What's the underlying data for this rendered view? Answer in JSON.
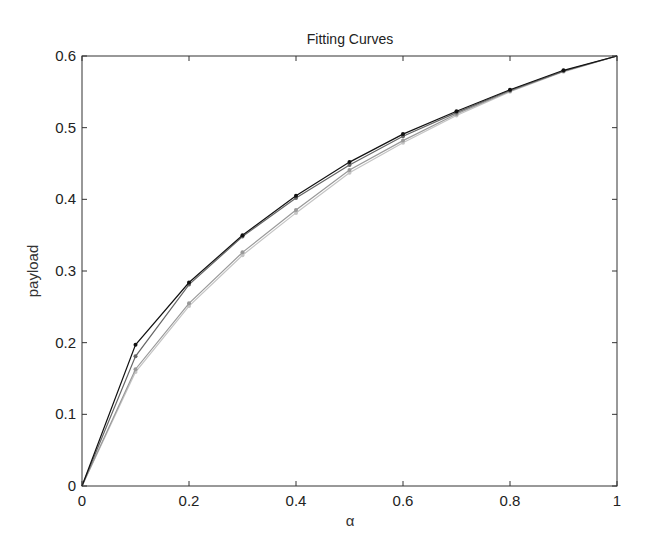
{
  "chart_data": {
    "type": "line",
    "title": "Fitting Curves",
    "xlabel": "α",
    "ylabel": "payload",
    "xlim": [
      0,
      1
    ],
    "ylim": [
      0,
      0.6
    ],
    "grid": false,
    "box": true,
    "legend": null,
    "x_ticks": [
      "0",
      "0.2",
      "0.4",
      "0.6",
      "0.8",
      "1"
    ],
    "y_ticks": [
      "0",
      "0.1",
      "0.2",
      "0.3",
      "0.4",
      "0.5",
      "0.6"
    ],
    "x": [
      0,
      0.1,
      0.2,
      0.3,
      0.4,
      0.5,
      0.6,
      0.7,
      0.8,
      0.9,
      1.0
    ],
    "series": [
      {
        "name": "curve-1",
        "color": "#111111",
        "values": [
          0,
          0.197,
          0.284,
          0.35,
          0.405,
          0.452,
          0.491,
          0.523,
          0.553,
          0.58,
          0.6
        ]
      },
      {
        "name": "curve-2",
        "color": "#666666",
        "values": [
          0,
          0.181,
          0.281,
          0.348,
          0.402,
          0.448,
          0.488,
          0.521,
          0.552,
          0.579,
          0.6
        ]
      },
      {
        "name": "curve-3",
        "color": "#999999",
        "values": [
          0,
          0.163,
          0.255,
          0.326,
          0.385,
          0.441,
          0.482,
          0.519,
          0.551,
          0.579,
          0.6
        ]
      },
      {
        "name": "curve-4",
        "color": "#c4c4c4",
        "values": [
          0,
          0.159,
          0.251,
          0.322,
          0.381,
          0.437,
          0.479,
          0.517,
          0.55,
          0.578,
          0.6
        ]
      }
    ]
  }
}
